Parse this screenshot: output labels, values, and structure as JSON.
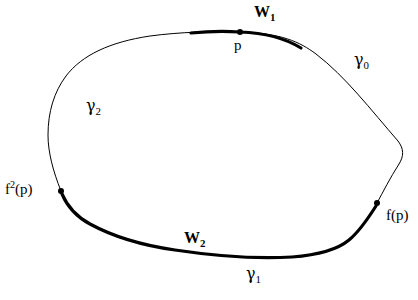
{
  "figure": {
    "type": "mathematical-diagram",
    "background_color": "#ffffff",
    "stroke_color": "#000000",
    "thin_stroke_width": 1,
    "thick_stroke_width": 3.2,
    "point_radius": 3
  },
  "labels": {
    "w1": {
      "text": "W",
      "sub": "1"
    },
    "p": {
      "text": "p"
    },
    "gamma0": {
      "text": "γ",
      "sub": "0"
    },
    "gamma2": {
      "text": "γ",
      "sub": "2"
    },
    "f2p": {
      "text": "f",
      "sup": "2",
      "tail": "(p)"
    },
    "fp": {
      "text": "f(p)"
    },
    "w2": {
      "text": "W",
      "sub": "2"
    },
    "gamma1": {
      "text": "γ",
      "sub": "1"
    }
  },
  "points": [
    {
      "name": "p",
      "x": 240,
      "y": 32
    },
    {
      "name": "f(p)",
      "x": 377,
      "y": 203
    },
    {
      "name": "f^2(p)",
      "x": 61,
      "y": 191
    }
  ],
  "arcs": {
    "closed_curve_path": "M 240 32 C 281 33 300 42 316 54 C 345 76 371 110 398 141 C 404 149 404 156 399 164 C 390 178 383 192 377 203 C 369 217 360 231 349 240 C 337 250 318 255 292 257 C 258 259 215 256 175 250 C 140 245 112 236 90 224 C 76 216 67 206 61 191 C 53 171 48 152 48 135 C 48 112 54 92 66 76 C 82 55 110 42 150 36 C 180 32 214 31 240 32 Z",
    "w1_thick_path": "M 191 33 C 210 31 226 31 240 32 C 268 33 288 40 301 48",
    "w2_thick_path": "M 62 194 C 68 208 77 217 90 224 C 112 236 140 245 175 250 C 215 256 258 259 292 257 C 318 255 337 250 349 240 C 360 231 369 217 376 206",
    "gamma0_range": "right arc from p region down past f(p)",
    "gamma1_range": "bottom arc",
    "gamma2_range": "left arc"
  }
}
